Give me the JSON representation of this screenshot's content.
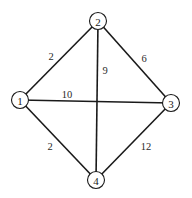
{
  "graph": {
    "type": "undirected-weighted",
    "colors": {
      "stroke": "#1a1a1a",
      "background": "#ffffff",
      "text": "#1a1a1a"
    },
    "nodes": [
      {
        "id": "1",
        "label": "1",
        "x": 20,
        "y": 100
      },
      {
        "id": "2",
        "label": "2",
        "x": 98,
        "y": 21
      },
      {
        "id": "3",
        "label": "3",
        "x": 171,
        "y": 103
      },
      {
        "id": "4",
        "label": "4",
        "x": 96,
        "y": 180
      }
    ],
    "edges": [
      {
        "from": "1",
        "to": "2",
        "weight": "2",
        "label_x": 51,
        "label_y": 56
      },
      {
        "from": "2",
        "to": "3",
        "weight": "6",
        "label_x": 144,
        "label_y": 58
      },
      {
        "from": "2",
        "to": "4",
        "weight": "9",
        "label_x": 105,
        "label_y": 70
      },
      {
        "from": "1",
        "to": "3",
        "weight": "10",
        "label_x": 67,
        "label_y": 94
      },
      {
        "from": "1",
        "to": "4",
        "weight": "2",
        "label_x": 50,
        "label_y": 146
      },
      {
        "from": "3",
        "to": "4",
        "weight": "12",
        "label_x": 146,
        "label_y": 146
      }
    ]
  }
}
